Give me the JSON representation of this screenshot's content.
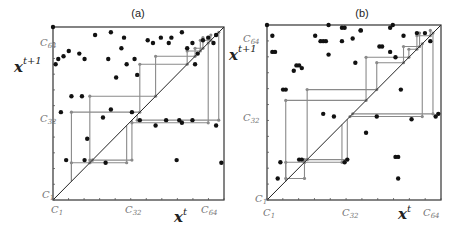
{
  "chart_data": [
    {
      "type": "scatter",
      "title": "(a)",
      "xlabel": "x^t",
      "ylabel": "x^{t+1}",
      "x_ticks": [
        "C1",
        "C32",
        "C64"
      ],
      "y_ticks": [
        "C1",
        "C32",
        "C64"
      ],
      "range": [
        1,
        66
      ],
      "diagonal": true,
      "points": [
        [
          1,
          66
        ],
        [
          17,
          63
        ],
        [
          23,
          64
        ],
        [
          28,
          62
        ],
        [
          37,
          61
        ],
        [
          39,
          60
        ],
        [
          42,
          62
        ],
        [
          46,
          62
        ],
        [
          50,
          64
        ],
        [
          27,
          58
        ],
        [
          7,
          57
        ],
        [
          3,
          54
        ],
        [
          11,
          56
        ],
        [
          13,
          54
        ],
        [
          5,
          55
        ],
        [
          45,
          60
        ],
        [
          22,
          54
        ],
        [
          32,
          54
        ],
        [
          52,
          58
        ],
        [
          2,
          52
        ],
        [
          29,
          52
        ],
        [
          33,
          48
        ],
        [
          25,
          47
        ],
        [
          58,
          61
        ],
        [
          60,
          62
        ],
        [
          63,
          63
        ],
        [
          62,
          60
        ],
        [
          54,
          60
        ],
        [
          56,
          56
        ],
        [
          8,
          40
        ],
        [
          12,
          40
        ],
        [
          23,
          35
        ],
        [
          4,
          34
        ],
        [
          20,
          32
        ],
        [
          31,
          34
        ],
        [
          34,
          31
        ],
        [
          44,
          31
        ],
        [
          49,
          31
        ],
        [
          50,
          30
        ],
        [
          54,
          31
        ],
        [
          40,
          29
        ],
        [
          63,
          29
        ],
        [
          14,
          24
        ],
        [
          6,
          16
        ],
        [
          13,
          16
        ],
        [
          21,
          15
        ],
        [
          48,
          16
        ],
        [
          65,
          15
        ],
        [
          55,
          52
        ]
      ],
      "cobweb": [
        [
          [
            8,
            8
          ],
          [
            8,
            34
          ],
          [
            34,
            34
          ],
          [
            34,
            52
          ],
          [
            52,
            52
          ],
          [
            52,
            57
          ],
          [
            57,
            57
          ],
          [
            57,
            61
          ],
          [
            61,
            61
          ],
          [
            61,
            63
          ]
        ],
        [
          [
            15,
            15
          ],
          [
            15,
            40
          ],
          [
            40,
            40
          ],
          [
            40,
            55
          ],
          [
            55,
            55
          ],
          [
            55,
            58
          ],
          [
            58,
            58
          ],
          [
            58,
            62
          ]
        ],
        [
          [
            8,
            8
          ],
          [
            8,
            15
          ],
          [
            15,
            15
          ],
          [
            15,
            16
          ],
          [
            16,
            16
          ]
        ],
        [
          [
            29,
            29
          ],
          [
            29,
            15
          ],
          [
            15,
            15
          ]
        ],
        [
          [
            31,
            31
          ],
          [
            31,
            16
          ],
          [
            16,
            16
          ]
        ],
        [
          [
            31,
            31
          ],
          [
            31,
            30
          ],
          [
            60,
            30
          ],
          [
            60,
            60
          ]
        ],
        [
          [
            33,
            33
          ],
          [
            33,
            31
          ],
          [
            64,
            31
          ],
          [
            64,
            64
          ]
        ]
      ]
    },
    {
      "type": "scatter",
      "title": "(b)",
      "xlabel": "x^t",
      "ylabel": "x^{t+1}",
      "x_ticks": [
        "C1",
        "C32",
        "C64"
      ],
      "y_ticks": [
        "C1",
        "C32",
        "C64"
      ],
      "range": [
        1,
        66
      ],
      "diagonal": true,
      "points": [
        [
          1,
          66
        ],
        [
          24,
          66
        ],
        [
          29,
          65
        ],
        [
          30,
          65
        ],
        [
          36,
          64
        ],
        [
          47,
          65
        ],
        [
          48,
          66
        ],
        [
          3,
          62
        ],
        [
          19,
          62
        ],
        [
          21,
          60
        ],
        [
          22,
          60
        ],
        [
          23,
          60
        ],
        [
          33,
          61
        ],
        [
          29,
          60
        ],
        [
          36,
          64
        ],
        [
          43,
          58
        ],
        [
          44,
          58
        ],
        [
          52,
          62
        ],
        [
          57,
          63
        ],
        [
          60,
          63
        ],
        [
          24,
          55
        ],
        [
          62,
          60
        ],
        [
          3,
          56
        ],
        [
          4,
          56
        ],
        [
          12,
          51
        ],
        [
          13,
          51
        ],
        [
          11,
          49
        ],
        [
          34,
          52
        ],
        [
          49,
          54
        ],
        [
          14,
          50
        ],
        [
          7,
          42
        ],
        [
          8,
          42
        ],
        [
          51,
          42
        ],
        [
          22,
          33
        ],
        [
          26,
          32
        ],
        [
          42,
          32
        ],
        [
          55,
          31
        ],
        [
          64,
          32
        ],
        [
          65,
          33
        ],
        [
          38,
          26
        ],
        [
          49,
          17
        ],
        [
          50,
          17
        ],
        [
          6,
          15
        ],
        [
          13,
          16
        ],
        [
          14,
          16
        ],
        [
          30,
          15
        ],
        [
          31,
          16
        ],
        [
          50,
          9
        ],
        [
          5,
          9
        ],
        [
          47,
          56
        ]
      ],
      "cobweb": [
        [
          [
            8,
            8
          ],
          [
            8,
            38
          ],
          [
            38,
            38
          ],
          [
            38,
            54
          ],
          [
            54,
            54
          ],
          [
            54,
            57
          ],
          [
            57,
            57
          ],
          [
            57,
            62
          ],
          [
            62,
            62
          ],
          [
            62,
            64
          ]
        ],
        [
          [
            16,
            16
          ],
          [
            16,
            42
          ],
          [
            42,
            42
          ],
          [
            42,
            52
          ],
          [
            52,
            52
          ],
          [
            52,
            58
          ],
          [
            58,
            58
          ],
          [
            58,
            63
          ]
        ],
        [
          [
            8,
            8
          ],
          [
            8,
            15
          ],
          [
            15,
            15
          ],
          [
            15,
            16
          ],
          [
            16,
            16
          ]
        ],
        [
          [
            15,
            15
          ],
          [
            15,
            9
          ],
          [
            8,
            9
          ]
        ],
        [
          [
            29,
            29
          ],
          [
            29,
            15
          ],
          [
            15,
            15
          ]
        ],
        [
          [
            31,
            31
          ],
          [
            31,
            16
          ],
          [
            16,
            16
          ]
        ],
        [
          [
            32,
            32
          ],
          [
            32,
            32
          ],
          [
            59,
            32
          ],
          [
            59,
            59
          ]
        ],
        [
          [
            33,
            33
          ],
          [
            33,
            33
          ],
          [
            63,
            33
          ],
          [
            63,
            63
          ]
        ]
      ]
    }
  ],
  "panels": [
    {
      "title": "(a)",
      "x_axis_label": "x",
      "x_axis_sup": "t",
      "y_axis_label": "x",
      "y_axis_sup": "t+1",
      "tick_c1": "C",
      "tick_c1_sub": "1",
      "tick_c32": "C",
      "tick_c32_sub": "32",
      "tick_c64": "C",
      "tick_c64_sub": "64"
    },
    {
      "title": "(b)",
      "x_axis_label": "x",
      "x_axis_sup": "t",
      "y_axis_label": "x",
      "y_axis_sup": "t+1",
      "tick_c1": "C",
      "tick_c1_sub": "1",
      "tick_c32": "C",
      "tick_c32_sub": "32",
      "tick_c64": "C",
      "tick_c64_sub": "64"
    }
  ],
  "colors": {
    "points": "#111111",
    "frame": "#333333",
    "cobweb": "#8a8a8a",
    "ticks": "#777777"
  }
}
